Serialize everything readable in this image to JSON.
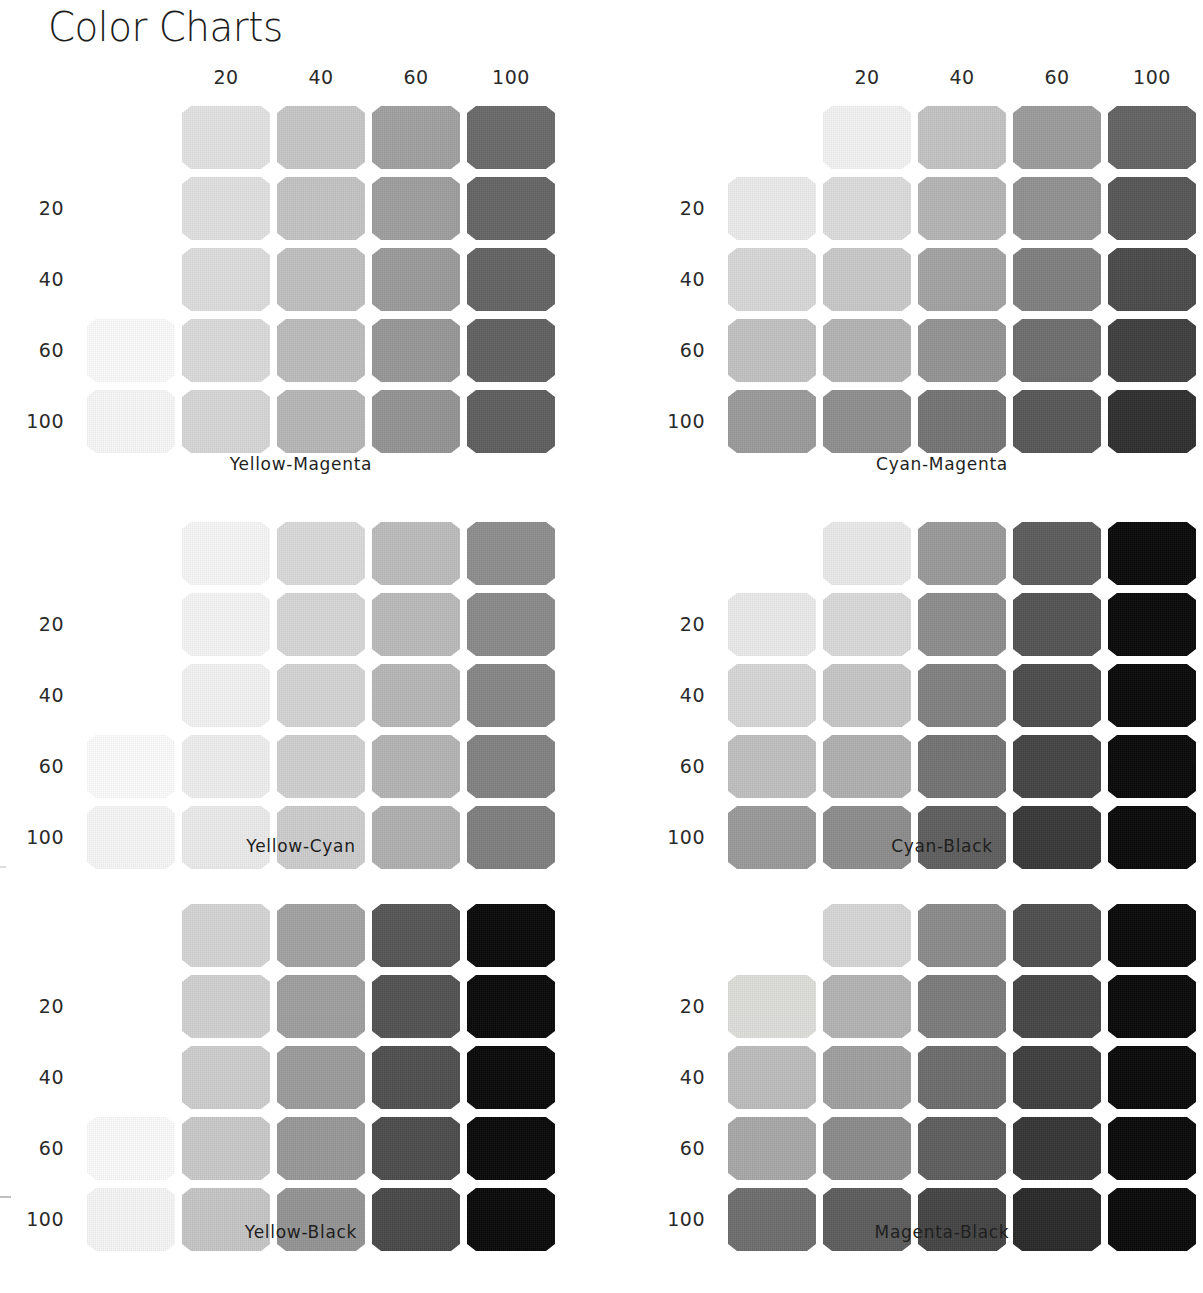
{
  "page": {
    "title": "Color Charts",
    "background": "#ffffff",
    "text_color": "#1f1f1f"
  },
  "axis": {
    "column_headers": [
      "20",
      "40",
      "60",
      "100"
    ],
    "row_labels": [
      "20",
      "40",
      "60",
      "100"
    ],
    "tint_steps": [
      0,
      20,
      40,
      60,
      100
    ]
  },
  "chart_data": [
    {
      "type": "heatmap",
      "title": "Yellow-Magenta",
      "xlabel": "Magenta",
      "ylabel": "Yellow",
      "x": [
        0,
        20,
        40,
        60,
        100
      ],
      "y": [
        0,
        20,
        40,
        60,
        100
      ],
      "xtick_labels": [
        "",
        "20",
        "40",
        "60",
        "100"
      ],
      "ytick_labels": [
        "",
        "20",
        "40",
        "60",
        "100"
      ],
      "grid": false,
      "legend": "none",
      "values": [
        [
          "#ffffff",
          "#e2e2e2",
          "#c6c6c6",
          "#a1a1a1",
          "#6b6b6b"
        ],
        [
          "#ffffff",
          "#e0e0e0",
          "#c4c4c4",
          "#9e9e9e",
          "#666666"
        ],
        [
          "#ffffff",
          "#dddddd",
          "#c0c0c0",
          "#9b9b9b",
          "#646464"
        ],
        [
          "#fafafa",
          "#dadada",
          "#bcbcbc",
          "#979797",
          "#626262"
        ],
        [
          "#f7f7f7",
          "#d6d6d6",
          "#b7b7b7",
          "#949494",
          "#5f5f5f"
        ]
      ]
    },
    {
      "type": "heatmap",
      "title": "Cyan-Magenta",
      "xlabel": "Magenta",
      "ylabel": "Cyan",
      "x": [
        0,
        20,
        40,
        60,
        100
      ],
      "y": [
        0,
        20,
        40,
        60,
        100
      ],
      "xtick_labels": [
        "",
        "20",
        "40",
        "60",
        "100"
      ],
      "ytick_labels": [
        "",
        "20",
        "40",
        "60",
        "100"
      ],
      "grid": false,
      "legend": "none",
      "values": [
        [
          "#ffffff",
          "#f2f2f2",
          "#c4c4c4",
          "#9d9d9d",
          "#636363"
        ],
        [
          "#ebebeb",
          "#dcdcdc",
          "#b5b5b5",
          "#919191",
          "#575757"
        ],
        [
          "#d8d8d8",
          "#c9c9c9",
          "#a4a4a4",
          "#808080",
          "#4b4b4b"
        ],
        [
          "#c2c2c2",
          "#b4b4b4",
          "#939393",
          "#6f6f6f",
          "#3f3f3f"
        ],
        [
          "#9b9b9b",
          "#909090",
          "#757575",
          "#585858",
          "#303030"
        ]
      ]
    },
    {
      "type": "heatmap",
      "title": "Yellow-Cyan",
      "xlabel": "Cyan",
      "ylabel": "Yellow",
      "x": [
        0,
        20,
        40,
        60,
        100
      ],
      "y": [
        0,
        20,
        40,
        60,
        100
      ],
      "xtick_labels": [
        "",
        "20",
        "40",
        "60",
        "100"
      ],
      "ytick_labels": [
        "",
        "20",
        "40",
        "60",
        "100"
      ],
      "grid": false,
      "legend": "none",
      "values": [
        [
          "#ffffff",
          "#f6f6f6",
          "#d9d9d9",
          "#bcbcbc",
          "#8e8e8e"
        ],
        [
          "#ffffff",
          "#f4f4f4",
          "#d6d6d6",
          "#bababa",
          "#8a8a8a"
        ],
        [
          "#ffffff",
          "#f2f2f2",
          "#d3d3d3",
          "#b7b7b7",
          "#878787"
        ],
        [
          "#fbfbfb",
          "#eeeeee",
          "#d0d0d0",
          "#b4b4b4",
          "#838383"
        ],
        [
          "#f6f6f6",
          "#ebebeb",
          "#cccccc",
          "#b0b0b0",
          "#7f7f7f"
        ]
      ]
    },
    {
      "type": "heatmap",
      "title": "Cyan-Black",
      "xlabel": "Black",
      "ylabel": "Cyan",
      "x": [
        0,
        20,
        40,
        60,
        100
      ],
      "y": [
        0,
        20,
        40,
        60,
        100
      ],
      "xtick_labels": [
        "",
        "20",
        "40",
        "60",
        "100"
      ],
      "ytick_labels": [
        "",
        "20",
        "40",
        "60",
        "100"
      ],
      "grid": false,
      "legend": "none",
      "values": [
        [
          "#ffffff",
          "#e9e9e9",
          "#9a9a9a",
          "#5d5d5d",
          "#0a0a0a"
        ],
        [
          "#eaeaea",
          "#d9d9d9",
          "#8d8d8d",
          "#555555",
          "#0a0a0a"
        ],
        [
          "#d7d7d7",
          "#c6c6c6",
          "#818181",
          "#4d4d4d",
          "#0a0a0a"
        ],
        [
          "#bfbfbf",
          "#b0b0b0",
          "#747474",
          "#454545",
          "#0a0a0a"
        ],
        [
          "#9a9a9a",
          "#8d8d8d",
          "#5f5f5f",
          "#393939",
          "#0a0a0a"
        ]
      ]
    },
    {
      "type": "heatmap",
      "title": "Yellow-Black",
      "xlabel": "Black",
      "ylabel": "Yellow",
      "x": [
        0,
        20,
        40,
        60,
        100
      ],
      "y": [
        0,
        20,
        40,
        60,
        100
      ],
      "xtick_labels": [
        "",
        "20",
        "40",
        "60",
        "100"
      ],
      "ytick_labels": [
        "",
        "20",
        "40",
        "60",
        "100"
      ],
      "grid": false,
      "legend": "none",
      "values": [
        [
          "#ffffff",
          "#d4d4d4",
          "#a3a3a3",
          "#565656",
          "#0a0a0a"
        ],
        [
          "#ffffff",
          "#d1d1d1",
          "#9f9f9f",
          "#535353",
          "#0a0a0a"
        ],
        [
          "#ffffff",
          "#cdcdcd",
          "#9c9c9c",
          "#505050",
          "#0a0a0a"
        ],
        [
          "#fafafa",
          "#c9c9c9",
          "#989898",
          "#4d4d4d",
          "#0a0a0a"
        ],
        [
          "#f5f5f5",
          "#c5c5c5",
          "#949494",
          "#4a4a4a",
          "#0a0a0a"
        ]
      ]
    },
    {
      "type": "heatmap",
      "title": "Magenta-Black",
      "xlabel": "Black",
      "ylabel": "Magenta",
      "x": [
        0,
        20,
        40,
        60,
        100
      ],
      "y": [
        0,
        20,
        40,
        60,
        100
      ],
      "xtick_labels": [
        "",
        "20",
        "40",
        "60",
        "100"
      ],
      "ytick_labels": [
        "",
        "20",
        "40",
        "60",
        "100"
      ],
      "grid": false,
      "legend": "none",
      "values": [
        [
          "#ffffff",
          "#d6d6d6",
          "#8b8b8b",
          "#4f4f4f",
          "#0a0a0a"
        ],
        [
          "#dededa",
          "#b3b3b3",
          "#7c7c7c",
          "#474747",
          "#0a0a0a"
        ],
        [
          "#bdbdbd",
          "#a0a0a0",
          "#6e6e6e",
          "#3f3f3f",
          "#0a0a0a"
        ],
        [
          "#a8a8a8",
          "#8b8b8b",
          "#5e5e5e",
          "#363636",
          "#0a0a0a"
        ],
        [
          "#6f6f6f",
          "#5d5d5d",
          "#454545",
          "#2a2a2a",
          "#0a0a0a"
        ]
      ]
    }
  ]
}
